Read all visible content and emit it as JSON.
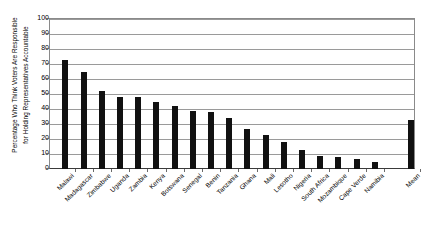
{
  "chart_data": {
    "type": "bar",
    "title": "",
    "subtitle": "",
    "xlabel": "",
    "ylabel": "Percentage Who Think Voters Are Responsible for Holding Representatives Accountable",
    "ylabel_lines": [
      "Percentage Who Think Voters Are Responsible",
      "for Holding Representatives Accountable"
    ],
    "ylim": [
      0,
      100
    ],
    "ytick_step": 10,
    "yticks": [
      0,
      10,
      20,
      30,
      40,
      50,
      60,
      70,
      80,
      90,
      100
    ],
    "ytick_labels": [
      "0",
      "10",
      "20",
      "30",
      "40",
      "50",
      "60",
      "70",
      "80",
      "90",
      "100"
    ],
    "grid": true,
    "grid_axis": "y",
    "legend": false,
    "legend_position": "none",
    "bar_color": "#111111",
    "grid_color": "#9a9a9a",
    "axis_color": "#6a6a6a",
    "categories": [
      "Malawi",
      "Madagascar",
      "Zimbabwe",
      "Uganda",
      "Zambia",
      "Kenya",
      "Botswana",
      "Senegal",
      "Benin",
      "Tanzania",
      "Ghana",
      "Mali",
      "Lesotho",
      "Nigeria",
      "South Africa",
      "Mozambique",
      "Cape Verde",
      "Namibia",
      "Mean"
    ],
    "values": [
      73,
      65,
      52,
      48,
      48,
      45,
      42,
      39,
      38,
      34,
      27,
      23,
      18,
      13,
      9,
      8,
      7,
      5,
      33
    ],
    "series": [
      {
        "name": "Percentage",
        "values": [
          73,
          65,
          52,
          48,
          48,
          45,
          42,
          39,
          38,
          34,
          27,
          23,
          18,
          13,
          9,
          8,
          7,
          5,
          33
        ]
      }
    ]
  }
}
